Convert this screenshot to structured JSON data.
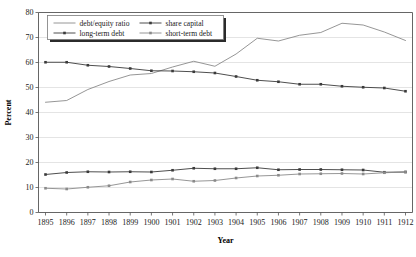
{
  "chart_data": {
    "type": "line",
    "title": "",
    "xlabel": "Year",
    "ylabel": "Percent",
    "grid": true,
    "legend_position": "top-left",
    "xlim": [
      1895,
      1912
    ],
    "ylim": [
      0,
      80
    ],
    "ytick_values": [
      0,
      10,
      20,
      30,
      40,
      50,
      60,
      70,
      80
    ],
    "ytick_labels": [
      "0",
      "10",
      "20",
      "30",
      "40",
      "50",
      "60",
      "70",
      "80"
    ],
    "categories": [
      1895,
      1896,
      1897,
      1898,
      1899,
      1900,
      1901,
      1902,
      1903,
      1904,
      1905,
      1906,
      1907,
      1908,
      1909,
      1910,
      1911,
      1912
    ],
    "xtick_labels": [
      "1895",
      "1896",
      "1897",
      "1898",
      "1899",
      "1900",
      "1901",
      "1902",
      "1903",
      "1904",
      "1905",
      "1906",
      "1907",
      "1908",
      "1909",
      "1910",
      "1911",
      "1912"
    ],
    "series": [
      {
        "name": "debt/equity ratio",
        "color": "#8a8a8a",
        "marker": "none",
        "values": [
          44.1,
          44.8,
          49.2,
          52.4,
          55.0,
          55.6,
          58.2,
          60.5,
          58.5,
          63.4,
          69.7,
          68.6,
          70.9,
          72.0,
          75.7,
          75.0,
          72.2,
          68.8
        ]
      },
      {
        "name": "share capital",
        "color": "#3a3a3a",
        "marker": "square",
        "values": [
          60.1,
          60.1,
          58.9,
          58.4,
          57.6,
          56.7,
          56.6,
          56.3,
          55.8,
          54.4,
          52.9,
          52.3,
          51.3,
          51.3,
          50.5,
          50.1,
          49.8,
          48.5
        ]
      },
      {
        "name": "long-term debt",
        "color": "#3a3a3a",
        "marker": "square",
        "values": [
          15.2,
          16.0,
          16.3,
          16.2,
          16.3,
          16.2,
          16.9,
          17.7,
          17.5,
          17.5,
          17.9,
          17.1,
          17.2,
          17.2,
          17.1,
          17.0,
          16.1,
          16.2
        ]
      },
      {
        "name": "short-term debt",
        "color": "#8a8a8a",
        "marker": "square",
        "values": [
          9.7,
          9.4,
          10.1,
          10.7,
          12.2,
          13.0,
          13.4,
          12.5,
          12.8,
          13.8,
          14.6,
          14.9,
          15.4,
          15.5,
          15.6,
          15.4,
          15.9,
          16.2
        ]
      }
    ],
    "legend_entries": [
      {
        "label": "debt/equity ratio",
        "color": "#8a8a8a",
        "marker": "none"
      },
      {
        "label": "share capital",
        "color": "#3a3a3a",
        "marker": "square"
      },
      {
        "label": "long-term debt",
        "color": "#3a3a3a",
        "marker": "square"
      },
      {
        "label": "short-term debt",
        "color": "#8a8a8a",
        "marker": "square"
      }
    ]
  }
}
